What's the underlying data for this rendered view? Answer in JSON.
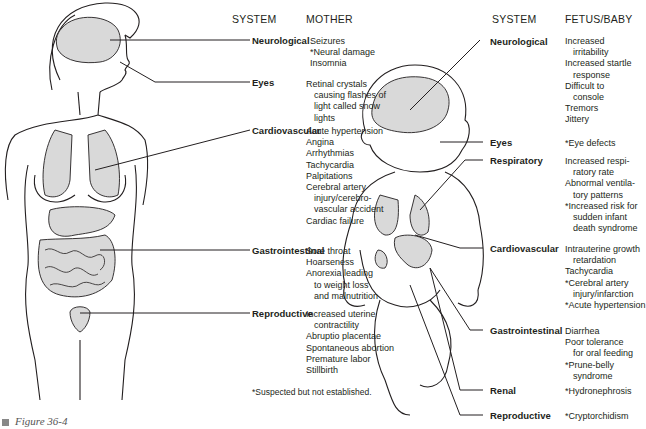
{
  "mother": {
    "header_system": "SYSTEM",
    "header_effects": "MOTHER",
    "systems": [
      {
        "label": "Neurological",
        "effects": [
          [
            "Seizures",
            false
          ],
          [
            "*Neural damage",
            false
          ],
          [
            "Insomnia",
            false
          ]
        ]
      },
      {
        "label": "Eyes",
        "effects": [
          [
            "Retinal crystals",
            false
          ],
          [
            "causing flashes of",
            true
          ],
          [
            "light called snow",
            true
          ],
          [
            "lights",
            true
          ]
        ]
      },
      {
        "label": "Cardiovascular",
        "effects": [
          [
            "Acute hypertension",
            false
          ],
          [
            "Angina",
            false
          ],
          [
            "Arrhythmias",
            false
          ],
          [
            "Tachycardia",
            false
          ],
          [
            "Palpitations",
            false
          ],
          [
            "Cerebral artery",
            false
          ],
          [
            "injury/cerebro-",
            true
          ],
          [
            "vascular accident",
            true
          ],
          [
            "Cardiac failure",
            false
          ]
        ]
      },
      {
        "label": "Gastrointestinal",
        "effects": [
          [
            "Sore throat",
            false
          ],
          [
            "Hoarseness",
            false
          ],
          [
            "Anorexia leading",
            false
          ],
          [
            "to weight loss",
            true
          ],
          [
            "and malnutrition",
            true
          ]
        ]
      },
      {
        "label": "Reproductive",
        "effects": [
          [
            "Increased uterine",
            false
          ],
          [
            "contractility",
            true
          ],
          [
            "Abruptio placentae",
            false
          ],
          [
            "Spontaneous abortion",
            false
          ],
          [
            "Premature labor",
            false
          ],
          [
            "Stillbirth",
            false
          ]
        ]
      }
    ],
    "footnote": "*Suspected but not established."
  },
  "fetus": {
    "header_system": "SYSTEM",
    "header_effects": "FETUS/BABY",
    "systems": [
      {
        "label": "Neurological",
        "effects": [
          [
            "Increased",
            false
          ],
          [
            "irritability",
            true
          ],
          [
            "Increased startle",
            false
          ],
          [
            "response",
            true
          ],
          [
            "Difficult to",
            false
          ],
          [
            "console",
            true
          ],
          [
            "Tremors",
            false
          ],
          [
            "Jittery",
            false
          ]
        ]
      },
      {
        "label": "Eyes",
        "effects": [
          [
            "*Eye defects",
            false
          ]
        ]
      },
      {
        "label": "Respiratory",
        "effects": [
          [
            "Increased respi-",
            false
          ],
          [
            "ratory rate",
            true
          ],
          [
            "Abnormal ventila-",
            false
          ],
          [
            "tory patterns",
            true
          ],
          [
            "*Increased risk for",
            false
          ],
          [
            "sudden infant",
            true
          ],
          [
            "death syndrome",
            true
          ]
        ]
      },
      {
        "label": "Cardiovascular",
        "effects": [
          [
            "Intrauterine growth",
            false
          ],
          [
            "retardation",
            true
          ],
          [
            "Tachycardia",
            false
          ],
          [
            "*Cerebral artery",
            false
          ],
          [
            "injury/infarction",
            true
          ],
          [
            "*Acute hypertension",
            false
          ]
        ]
      },
      {
        "label": "Gastrointestinal",
        "effects": [
          [
            "Diarrhea",
            false
          ],
          [
            "Poor tolerance",
            false
          ],
          [
            "for oral feeding",
            true
          ],
          [
            "*Prune-belly",
            false
          ],
          [
            "syndrome",
            true
          ]
        ]
      },
      {
        "label": "Renal",
        "effects": [
          [
            "*Hydronephrosis",
            false
          ]
        ]
      },
      {
        "label": "Reproductive",
        "effects": [
          [
            "*Cryptorchidism",
            false
          ]
        ]
      }
    ]
  },
  "caption": "Figure 36-4",
  "colors": {
    "ink": "#231f20",
    "organ_fill": "#d9d9d9",
    "caption_square": "#888888"
  }
}
